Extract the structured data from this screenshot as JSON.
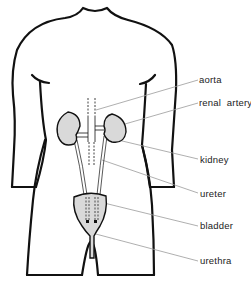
{
  "diagram": {
    "type": "anatomical-diagram",
    "colors": {
      "outline": "#111111",
      "organ_fill": "#d9d9d9",
      "leader_line": "#9a9a9a",
      "background": "#ffffff"
    },
    "labels": [
      {
        "id": "aorta",
        "text": "aorta",
        "x": 199,
        "y": 74
      },
      {
        "id": "renal-artery",
        "text": "renal  artery",
        "x": 199,
        "y": 97
      },
      {
        "id": "kidney",
        "text": "kidney",
        "x": 200,
        "y": 154
      },
      {
        "id": "ureter",
        "text": "ureter",
        "x": 200,
        "y": 188
      },
      {
        "id": "bladder",
        "text": "bladder",
        "x": 200,
        "y": 220
      },
      {
        "id": "urethra",
        "text": "urethra",
        "x": 200,
        "y": 255
      }
    ]
  }
}
